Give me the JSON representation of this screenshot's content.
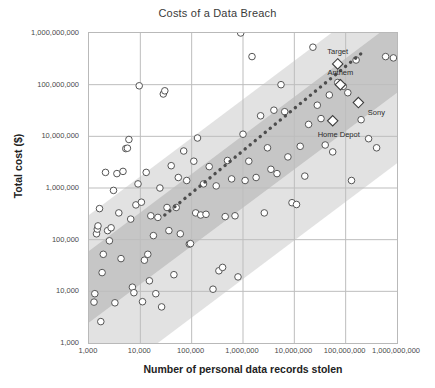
{
  "chart_data": {
    "type": "scatter",
    "title": "Costs of a Data Breach",
    "xlabel": "Number of personal data records stolen",
    "ylabel": "Total cost ($)",
    "xscale": "log",
    "yscale": "log",
    "xlim": [
      1000,
      1000000000
    ],
    "ylim": [
      1000,
      1000000000
    ],
    "grid": true,
    "legend": "none",
    "xticks": [
      {
        "value": 1000,
        "label": "1,000"
      },
      {
        "value": 10000,
        "label": "10,000"
      },
      {
        "value": 100000,
        "label": "100,000"
      },
      {
        "value": 1000000,
        "label": "1,000,000"
      },
      {
        "value": 10000000,
        "label": "10,000,000"
      },
      {
        "value": 100000000,
        "label": "100,000,000"
      },
      {
        "value": 1000000000,
        "label": "1,000,000,000"
      }
    ],
    "yticks": [
      {
        "value": 1000,
        "label": "1,000"
      },
      {
        "value": 10000,
        "label": "10,000"
      },
      {
        "value": 100000,
        "label": "100,000"
      },
      {
        "value": 1000000,
        "label": "1,000,000"
      },
      {
        "value": 10000000,
        "label": "10,000,000"
      },
      {
        "value": 100000000,
        "label": "100,000,000"
      },
      {
        "value": 1000000000,
        "label": "1,000,000,000"
      }
    ],
    "colors": {
      "marker_fill": "#ffffff",
      "marker_stroke": "#555555",
      "band_outer": "#e2e2e2",
      "band_inner": "#c6c6c6",
      "trend_line": "#4d4d4d",
      "grid": "#bdbdbd",
      "frame": "#b9b9b9",
      "text": "#3a3a3a"
    },
    "bands": [
      {
        "name": "outer-confidence-band",
        "fill": "#e2e2e2",
        "description": "Wide diagonal confidence band around the trend",
        "lower_line": {
          "x1": 1000,
          "y1": 100,
          "x2": 1000000000,
          "y2": 3000000
        },
        "upper_line": {
          "x1": 1000,
          "y1": 300000,
          "x2": 1000000000,
          "y2": 9000000000
        }
      },
      {
        "name": "inner-confidence-band",
        "fill": "#c6c6c6",
        "description": "Narrow diagonal confidence band around the trend",
        "lower_line": {
          "x1": 1000,
          "y1": 2500,
          "x2": 1000000000,
          "y2": 70000000
        },
        "upper_line": {
          "x1": 1000,
          "y1": 60000,
          "x2": 1000000000,
          "y2": 1800000000
        }
      }
    ],
    "trend_line": {
      "style": "dotted",
      "x1": 30000,
      "y1": 300000,
      "x2": 200000000,
      "y2": 400000000
    },
    "labeled_points": [
      {
        "name": "Target",
        "x": 70000000,
        "y": 252000000,
        "marker": "diamond",
        "label_dx": 0,
        "label_dy": -13
      },
      {
        "name": "Anthem",
        "x": 78800000,
        "y": 100000000,
        "marker": "diamond",
        "label_dx": 0,
        "label_dy": -13
      },
      {
        "name": "Sony",
        "x": 177000000,
        "y": 45000000,
        "marker": "diamond",
        "label_dx": 18,
        "label_dy": 9
      },
      {
        "name": "Home Depot",
        "x": 56000000,
        "y": 20000000,
        "marker": "diamond",
        "label_dx": 6,
        "label_dy": 13
      }
    ],
    "points": [
      {
        "x": 1250,
        "y": 6200
      },
      {
        "x": 1300,
        "y": 9000
      },
      {
        "x": 1400,
        "y": 130000
      },
      {
        "x": 1450,
        "y": 160000
      },
      {
        "x": 1500,
        "y": 185000
      },
      {
        "x": 1600,
        "y": 400000
      },
      {
        "x": 1700,
        "y": 2600
      },
      {
        "x": 1800,
        "y": 23000
      },
      {
        "x": 1900,
        "y": 52000
      },
      {
        "x": 2100,
        "y": 2000000
      },
      {
        "x": 2300,
        "y": 150000
      },
      {
        "x": 2500,
        "y": 95000
      },
      {
        "x": 2700,
        "y": 170000
      },
      {
        "x": 3000,
        "y": 900000
      },
      {
        "x": 3200,
        "y": 6000
      },
      {
        "x": 3500,
        "y": 1900000
      },
      {
        "x": 3800,
        "y": 330000
      },
      {
        "x": 4200,
        "y": 43000
      },
      {
        "x": 4600,
        "y": 2100000
      },
      {
        "x": 5200,
        "y": 5800000
      },
      {
        "x": 5600,
        "y": 5900000
      },
      {
        "x": 6000,
        "y": 8700000
      },
      {
        "x": 6500,
        "y": 250000
      },
      {
        "x": 7000,
        "y": 12000
      },
      {
        "x": 7500,
        "y": 9400
      },
      {
        "x": 8200,
        "y": 470000
      },
      {
        "x": 9000,
        "y": 1200000
      },
      {
        "x": 9500,
        "y": 95000000
      },
      {
        "x": 10500,
        "y": 530000
      },
      {
        "x": 11000,
        "y": 6300
      },
      {
        "x": 12000,
        "y": 40000
      },
      {
        "x": 13000,
        "y": 2000000
      },
      {
        "x": 14000,
        "y": 52000
      },
      {
        "x": 15000,
        "y": 16000
      },
      {
        "x": 16000,
        "y": 290000
      },
      {
        "x": 18000,
        "y": 120000
      },
      {
        "x": 20000,
        "y": 9000
      },
      {
        "x": 22000,
        "y": 270000
      },
      {
        "x": 24000,
        "y": 1000000
      },
      {
        "x": 26000,
        "y": 5000
      },
      {
        "x": 28000,
        "y": 66000000
      },
      {
        "x": 30000,
        "y": 76000000
      },
      {
        "x": 33000,
        "y": 420000
      },
      {
        "x": 36000,
        "y": 150000
      },
      {
        "x": 40000,
        "y": 2700000
      },
      {
        "x": 45000,
        "y": 21000
      },
      {
        "x": 50000,
        "y": 420000
      },
      {
        "x": 55000,
        "y": 1600000
      },
      {
        "x": 60000,
        "y": 130000
      },
      {
        "x": 70000,
        "y": 5200000
      },
      {
        "x": 80000,
        "y": 1400000
      },
      {
        "x": 90000,
        "y": 82000
      },
      {
        "x": 95000,
        "y": 84000
      },
      {
        "x": 110000,
        "y": 3300000
      },
      {
        "x": 120000,
        "y": 330000
      },
      {
        "x": 130000,
        "y": 9300000
      },
      {
        "x": 150000,
        "y": 300000
      },
      {
        "x": 170000,
        "y": 1200000
      },
      {
        "x": 190000,
        "y": 310000
      },
      {
        "x": 220000,
        "y": 2600000
      },
      {
        "x": 260000,
        "y": 11000
      },
      {
        "x": 300000,
        "y": 1100000
      },
      {
        "x": 340000,
        "y": 25000
      },
      {
        "x": 400000,
        "y": 29000
      },
      {
        "x": 450000,
        "y": 280000
      },
      {
        "x": 500000,
        "y": 3400000
      },
      {
        "x": 600000,
        "y": 1500000
      },
      {
        "x": 700000,
        "y": 290000
      },
      {
        "x": 800000,
        "y": 19000
      },
      {
        "x": 900000,
        "y": 1000000000
      },
      {
        "x": 1000000,
        "y": 11000000
      },
      {
        "x": 1100000,
        "y": 1400000
      },
      {
        "x": 1300000,
        "y": 3300000
      },
      {
        "x": 1500000,
        "y": 350000000
      },
      {
        "x": 1800000,
        "y": 1600000
      },
      {
        "x": 2200000,
        "y": 25000000
      },
      {
        "x": 2600000,
        "y": 330000
      },
      {
        "x": 3000000,
        "y": 6000000
      },
      {
        "x": 3500000,
        "y": 2300000
      },
      {
        "x": 4000000,
        "y": 32000000
      },
      {
        "x": 4600000,
        "y": 1900000
      },
      {
        "x": 5500000,
        "y": 100000000
      },
      {
        "x": 6500000,
        "y": 30000000
      },
      {
        "x": 7500000,
        "y": 4000000
      },
      {
        "x": 9000000,
        "y": 520000
      },
      {
        "x": 11000000,
        "y": 480000
      },
      {
        "x": 13000000,
        "y": 6400000
      },
      {
        "x": 16000000,
        "y": 1700000
      },
      {
        "x": 19000000,
        "y": 17000000
      },
      {
        "x": 23000000,
        "y": 530000000
      },
      {
        "x": 28000000,
        "y": 40000000
      },
      {
        "x": 33000000,
        "y": 22000000
      },
      {
        "x": 40000000,
        "y": 6800000
      },
      {
        "x": 48000000,
        "y": 63000000
      },
      {
        "x": 56000000,
        "y": 5000000
      },
      {
        "x": 70000000,
        "y": 110000000
      },
      {
        "x": 90000000,
        "y": 93000000
      },
      {
        "x": 110000000,
        "y": 70000000
      },
      {
        "x": 130000000,
        "y": 1400000
      },
      {
        "x": 160000000,
        "y": 300000000
      },
      {
        "x": 200000000,
        "y": 21000000
      },
      {
        "x": 280000000,
        "y": 9000000
      },
      {
        "x": 400000000,
        "y": 6000000
      },
      {
        "x": 600000000,
        "y": 350000000
      },
      {
        "x": 850000000,
        "y": 330000000
      }
    ]
  }
}
